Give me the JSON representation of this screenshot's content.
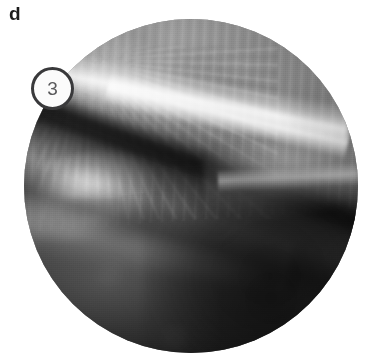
{
  "figure": {
    "panel_label": "d",
    "type": "arthroscopic-photograph",
    "background_color": "#ffffff",
    "viewport": {
      "shape": "circle",
      "center_x": 191,
      "center_y": 186,
      "radius": 167,
      "modality": "grayscale endoscopic view"
    }
  },
  "annotations": [
    {
      "id": "marker-3",
      "label": "3",
      "shape": "circle",
      "center_x": 52,
      "center_y": 88,
      "diameter": 43,
      "ring_color": "#39393b",
      "fill_color": "#fbfbfb",
      "text_color": "#5a5a5c"
    }
  ],
  "palette": {
    "page_background": "#ffffff",
    "label_text": "#1b1b1b",
    "tissue_highlight": "#f7f7f7",
    "tissue_light": "#c8c8c8",
    "tissue_mid": "#8d8d8d",
    "tissue_dark": "#414141",
    "tissue_deep_shadow": "#161616",
    "marker_ring": "#39393b",
    "marker_fill": "#fbfbfb",
    "marker_digit": "#5a5a5c"
  },
  "image_features": [
    {
      "name": "fibrous-striated-tissue-upper-left",
      "tone": "light-gray"
    },
    {
      "name": "bright-specular-streak-upper-center",
      "tone": "white"
    },
    {
      "name": "dark-diagonal-cleft-midline",
      "tone": "near-black"
    },
    {
      "name": "bright-highlight-mid-left",
      "tone": "white"
    },
    {
      "name": "lighter-ridge-mid-right",
      "tone": "light-gray"
    },
    {
      "name": "dark-trough-lower",
      "tone": "dark-gray"
    },
    {
      "name": "deep-shadow-lower-right",
      "tone": "near-black"
    },
    {
      "name": "mottled-lobe-lower-left",
      "tone": "mid-gray"
    }
  ]
}
